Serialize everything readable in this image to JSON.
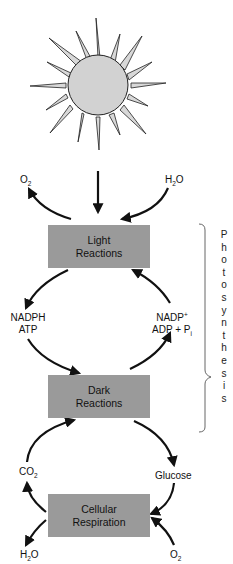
{
  "diagram": {
    "colors": {
      "box_fill": "#9a9a9a",
      "sun_fill": "#d2d2d2",
      "arrow": "#111111"
    },
    "sun": {
      "label": "sun-icon"
    },
    "boxes": {
      "light": {
        "line1": "Light",
        "line2": "Reactions"
      },
      "dark": {
        "line1": "Dark",
        "line2": "Reactions"
      },
      "respiration": {
        "line1": "Cellular",
        "line2": "Respiration"
      }
    },
    "labels": {
      "o2_top": {
        "main": "O",
        "sub": "2"
      },
      "h2o_top": {
        "pre": "H",
        "sub": "2",
        "post": "O"
      },
      "nadph": "NADPH",
      "atp": "ATP",
      "nadp": {
        "main": "NADP",
        "sup": "+"
      },
      "adp": {
        "main": "ADP + P",
        "sub": "i"
      },
      "co2": {
        "main": "CO",
        "sub": "2"
      },
      "glucose": "Glucose",
      "h2o_bottom": {
        "pre": "H",
        "sub": "2",
        "post": "O"
      },
      "o2_bottom": {
        "main": "O",
        "sub": "2"
      }
    },
    "bracket_label": [
      "P",
      "h",
      "o",
      "t",
      "o",
      "s",
      "y",
      "n",
      "t",
      "h",
      "e",
      "s",
      "i",
      "s"
    ]
  }
}
